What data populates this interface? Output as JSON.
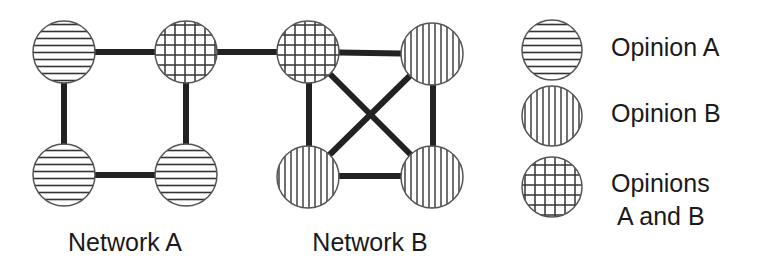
{
  "diagram": {
    "networks": [
      {
        "label": "Network A",
        "nodes": [
          {
            "id": "A1",
            "opinion": "A"
          },
          {
            "id": "A2",
            "opinion": "AB"
          },
          {
            "id": "A3",
            "opinion": "A"
          },
          {
            "id": "A4",
            "opinion": "A"
          }
        ],
        "edges": [
          [
            "A1",
            "A2"
          ],
          [
            "A1",
            "A3"
          ],
          [
            "A2",
            "A4"
          ],
          [
            "A3",
            "A4"
          ]
        ]
      },
      {
        "label": "Network B",
        "nodes": [
          {
            "id": "B1",
            "opinion": "AB"
          },
          {
            "id": "B2",
            "opinion": "B"
          },
          {
            "id": "B3",
            "opinion": "B"
          },
          {
            "id": "B4",
            "opinion": "B"
          }
        ],
        "edges": [
          [
            "B1",
            "B2"
          ],
          [
            "B1",
            "B3"
          ],
          [
            "B2",
            "B4"
          ],
          [
            "B3",
            "B4"
          ],
          [
            "B1",
            "B4"
          ],
          [
            "B2",
            "B3"
          ]
        ]
      }
    ],
    "bridge_edge": [
      "A2",
      "B1"
    ],
    "legend": [
      {
        "pattern": "horizontal-stripes",
        "label": "Opinion A"
      },
      {
        "pattern": "vertical-stripes",
        "label": "Opinion B"
      },
      {
        "pattern": "grid",
        "label_line1": "Opinions",
        "label_line2": "A and B"
      }
    ]
  }
}
